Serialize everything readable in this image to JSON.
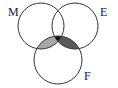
{
  "diagram": {
    "type": "venn",
    "sets": [
      {
        "label": "M",
        "cx": 41,
        "cy": 26,
        "r": 23
      },
      {
        "label": "E",
        "cx": 75,
        "cy": 26,
        "r": 23
      },
      {
        "label": "F",
        "cx": 58,
        "cy": 60,
        "r": 24
      }
    ],
    "shaded_regions": [
      {
        "region": "M∩F only",
        "color": "#a8a8a8"
      },
      {
        "region": "E∩F only",
        "color": "#5a5a5a"
      },
      {
        "region": "M∩E∩F",
        "color": "#111111"
      }
    ],
    "labels": {
      "m": "M",
      "e": "E",
      "f": "F"
    }
  }
}
